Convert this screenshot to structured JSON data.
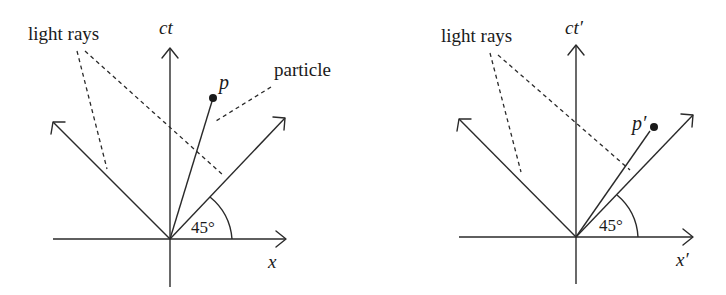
{
  "diagrams": [
    {
      "id": "rest-frame",
      "vertical_axis_label": "ct",
      "horizontal_axis_label": "x",
      "light_rays_label": "light rays",
      "particle_label": "particle",
      "point_label": "p",
      "angle_label": "45°",
      "colors": {
        "stroke": "#2a2a2a",
        "text": "#1a1a1a",
        "background": "#ffffff"
      }
    },
    {
      "id": "moving-frame",
      "vertical_axis_label": "ct′",
      "horizontal_axis_label": "x′",
      "light_rays_label": "light rays",
      "point_label": "p′",
      "angle_label": "45°",
      "colors": {
        "stroke": "#2a2a2a",
        "text": "#1a1a1a",
        "background": "#ffffff"
      }
    }
  ]
}
